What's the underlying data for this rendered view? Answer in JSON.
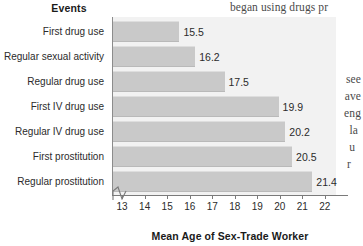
{
  "page": {
    "background_text_right": [
      "began using drugs pr",
      "graphically illustra",
      "among prostitutes",
      "was not until",
      "see",
      "ave",
      "eng",
      "la",
      "u",
      "r"
    ]
  },
  "chart_data": {
    "type": "bar",
    "orientation": "horizontal",
    "title": "",
    "categories": [
      "First drug use",
      "Regular sexual activity",
      "Regular drug use",
      "First IV drug use",
      "Regular IV drug use",
      "First prostitution",
      "Regular prostitution"
    ],
    "values": [
      15.5,
      16.2,
      17.5,
      19.9,
      20.2,
      20.5,
      21.4
    ],
    "value_labels": [
      "15.5",
      "16.2",
      "17.5",
      "19.9",
      "20.2",
      "20.5",
      "21.4"
    ],
    "category_axis_title": "Events",
    "xlabel": "Mean Age of Sex-Trade Worker",
    "ylabel": "Events",
    "xticks": [
      13,
      14,
      15,
      16,
      17,
      18,
      19,
      20,
      21,
      22
    ],
    "xtick_labels": [
      "13",
      "14",
      "15",
      "16",
      "17",
      "18",
      "19",
      "20",
      "21",
      "22"
    ],
    "xlim": [
      12.55,
      22.45
    ],
    "axis_break": true,
    "grid": false,
    "legend": "none",
    "bar_color": "#c9c9c9",
    "plot_background": "#f2f2f2",
    "text_color": "#2b2b2b"
  }
}
